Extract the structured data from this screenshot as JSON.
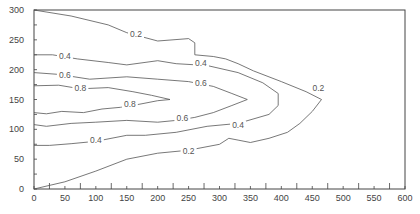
{
  "chart_data": {
    "type": "contour",
    "title": "",
    "xlabel": "",
    "ylabel": "",
    "xlim": [
      0,
      600
    ],
    "ylim": [
      0,
      300
    ],
    "grid": false,
    "legend": null,
    "x_ticks": [
      0,
      50,
      100,
      150,
      200,
      250,
      300,
      350,
      400,
      450,
      500,
      550,
      600
    ],
    "y_ticks": [
      0,
      50,
      100,
      150,
      200,
      250,
      300
    ],
    "x_tick_labels": [
      "0",
      "50",
      "100",
      "150",
      "200",
      "250",
      "300",
      "350",
      "400",
      "450",
      "500",
      "550",
      "600"
    ],
    "y_tick_labels": [
      "0",
      "50",
      "100",
      "150",
      "200",
      "250",
      "300"
    ],
    "contour_levels": [
      0.2,
      0.4,
      0.6,
      0.8
    ],
    "contours": [
      {
        "level": 0.2,
        "label": "0.2",
        "points": [
          [
            0,
            300
          ],
          [
            60,
            290
          ],
          [
            120,
            275
          ],
          [
            150,
            262
          ],
          [
            200,
            248
          ],
          [
            250,
            252
          ],
          [
            260,
            245
          ],
          [
            260,
            225
          ],
          [
            290,
            222
          ],
          [
            310,
            218
          ],
          [
            330,
            210
          ],
          [
            355,
            198
          ],
          [
            400,
            180
          ],
          [
            440,
            163
          ],
          [
            465,
            150
          ],
          [
            450,
            130
          ],
          [
            430,
            110
          ],
          [
            410,
            95
          ],
          [
            380,
            85
          ],
          [
            350,
            78
          ],
          [
            330,
            82
          ],
          [
            315,
            85
          ],
          [
            300,
            75
          ],
          [
            250,
            65
          ],
          [
            200,
            60
          ],
          [
            150,
            50
          ],
          [
            100,
            30
          ],
          [
            50,
            12
          ],
          [
            0,
            0
          ]
        ],
        "label_positions": [
          [
            165,
            258
          ],
          [
            460,
            168
          ],
          [
            250,
            62
          ]
        ]
      },
      {
        "level": 0.4,
        "label": "0.4",
        "points": [
          [
            0,
            225
          ],
          [
            30,
            225
          ],
          [
            70,
            218
          ],
          [
            120,
            212
          ],
          [
            150,
            208
          ],
          [
            200,
            215
          ],
          [
            230,
            210
          ],
          [
            280,
            207
          ],
          [
            330,
            195
          ],
          [
            370,
            178
          ],
          [
            395,
            160
          ],
          [
            395,
            140
          ],
          [
            380,
            125
          ],
          [
            330,
            110
          ],
          [
            280,
            105
          ],
          [
            230,
            95
          ],
          [
            180,
            90
          ],
          [
            150,
            90
          ],
          [
            100,
            80
          ],
          [
            60,
            76
          ],
          [
            25,
            73
          ],
          [
            0,
            73
          ]
        ],
        "label_positions": [
          [
            50,
            221
          ],
          [
            270,
            209
          ],
          [
            330,
            105
          ],
          [
            100,
            80
          ]
        ]
      },
      {
        "level": 0.6,
        "label": "0.6",
        "points": [
          [
            0,
            195
          ],
          [
            40,
            192
          ],
          [
            90,
            184
          ],
          [
            150,
            188
          ],
          [
            200,
            184
          ],
          [
            250,
            180
          ],
          [
            290,
            172
          ],
          [
            320,
            160
          ],
          [
            345,
            150
          ],
          [
            320,
            140
          ],
          [
            290,
            128
          ],
          [
            260,
            120
          ],
          [
            230,
            115
          ],
          [
            200,
            112
          ],
          [
            150,
            115
          ],
          [
            100,
            112
          ],
          [
            60,
            110
          ],
          [
            20,
            105
          ],
          [
            0,
            108
          ]
        ],
        "label_positions": [
          [
            50,
            189
          ],
          [
            270,
            176
          ],
          [
            240,
            117
          ]
        ]
      },
      {
        "level": 0.8,
        "label": "0.8",
        "points": [
          [
            0,
            173
          ],
          [
            40,
            174
          ],
          [
            75,
            168
          ],
          [
            120,
            170
          ],
          [
            160,
            163
          ],
          [
            190,
            157
          ],
          [
            220,
            150
          ],
          [
            200,
            148
          ],
          [
            170,
            142
          ],
          [
            140,
            137
          ],
          [
            110,
            134
          ],
          [
            80,
            128
          ],
          [
            45,
            130
          ],
          [
            20,
            126
          ],
          [
            0,
            128
          ]
        ],
        "label_positions": [
          [
            75,
            167
          ],
          [
            155,
            140
          ]
        ]
      }
    ]
  }
}
